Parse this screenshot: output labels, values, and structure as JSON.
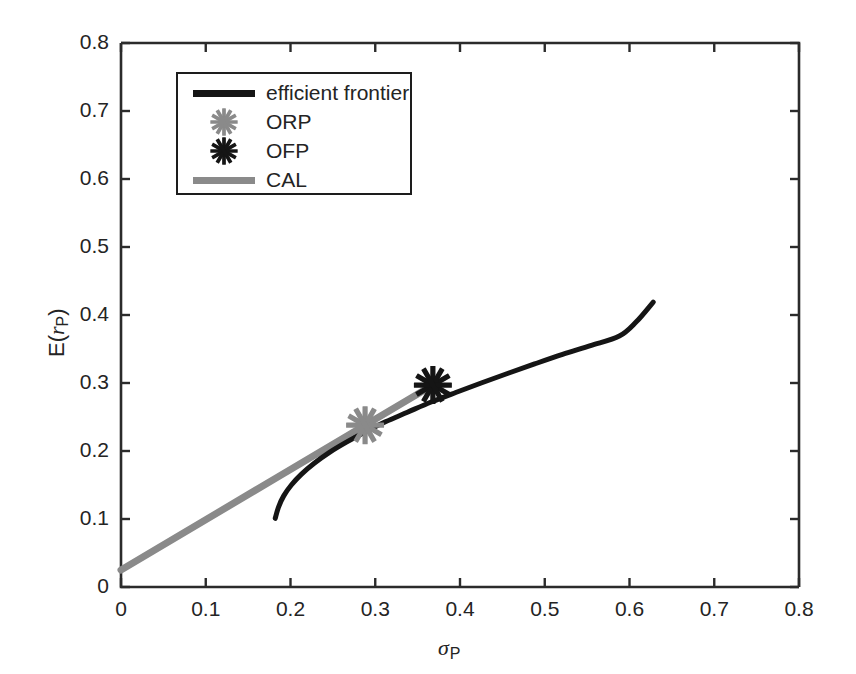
{
  "chart_data": {
    "type": "line",
    "title": "",
    "subtitle": "",
    "xlabel": "sigma_P",
    "ylabel": "E(r_P)",
    "xlim": [
      0,
      0.8
    ],
    "ylim": [
      0,
      0.8
    ],
    "xticks": [
      "0",
      "0.1",
      "0.2",
      "0.3",
      "0.4",
      "0.5",
      "0.6",
      "0.7",
      "0.8"
    ],
    "xtick_values": [
      0,
      0.1,
      0.2,
      0.3,
      0.4,
      0.5,
      0.6,
      0.7,
      0.8
    ],
    "yticks": [
      "0",
      "0.1",
      "0.2",
      "0.3",
      "0.4",
      "0.5",
      "0.6",
      "0.7",
      "0.8"
    ],
    "ytick_values": [
      0,
      0.1,
      0.2,
      0.3,
      0.4,
      0.5,
      0.6,
      0.7,
      0.8
    ],
    "grid": false,
    "legend_position": "upper-left-inside",
    "series": [
      {
        "name": "efficient frontier",
        "kind": "line",
        "color": "#151515",
        "linewidth": 5,
        "points": [
          [
            0.182,
            0.101
          ],
          [
            0.186,
            0.118
          ],
          [
            0.192,
            0.134
          ],
          [
            0.201,
            0.15
          ],
          [
            0.213,
            0.166
          ],
          [
            0.228,
            0.182
          ],
          [
            0.246,
            0.198
          ],
          [
            0.266,
            0.213
          ],
          [
            0.288,
            0.228
          ],
          [
            0.312,
            0.243
          ],
          [
            0.338,
            0.257
          ],
          [
            0.366,
            0.272
          ],
          [
            0.395,
            0.286
          ],
          [
            0.425,
            0.3
          ],
          [
            0.456,
            0.314
          ],
          [
            0.488,
            0.328
          ],
          [
            0.521,
            0.342
          ],
          [
            0.554,
            0.355
          ],
          [
            0.588,
            0.369
          ],
          [
            0.608,
            0.39
          ],
          [
            0.628,
            0.419
          ]
        ]
      },
      {
        "name": "CAL",
        "kind": "line",
        "color": "#8a8a8a",
        "linewidth": 7,
        "points": [
          [
            0.0,
            0.025
          ],
          [
            0.372,
            0.3
          ]
        ]
      },
      {
        "name": "ORP",
        "kind": "marker",
        "marker": "asterisk",
        "color": "#8a8a8a",
        "points": [
          [
            0.288,
            0.238
          ]
        ]
      },
      {
        "name": "OFP",
        "kind": "marker",
        "marker": "asterisk",
        "color": "#151515",
        "points": [
          [
            0.368,
            0.297
          ]
        ]
      }
    ],
    "annotations": {
      "risk_free_rate": 0.025,
      "min_variance_point": [
        0.182,
        0.101
      ],
      "orp_point": [
        0.288,
        0.238
      ],
      "ofp_point": [
        0.368,
        0.297
      ]
    }
  },
  "legend": {
    "items": [
      {
        "label": "efficient frontier",
        "kind": "line",
        "color": "#151515"
      },
      {
        "label": "ORP",
        "kind": "marker",
        "color": "#8a8a8a"
      },
      {
        "label": "OFP",
        "kind": "marker",
        "color": "#151515"
      },
      {
        "label": "CAL",
        "kind": "line",
        "color": "#8a8a8a"
      }
    ]
  },
  "axes": {
    "x_title_main": "σ",
    "x_title_sub": "P",
    "y_title_prefix": "E(",
    "y_title_var": "r",
    "y_title_sub": "P",
    "y_title_suffix": ")"
  }
}
